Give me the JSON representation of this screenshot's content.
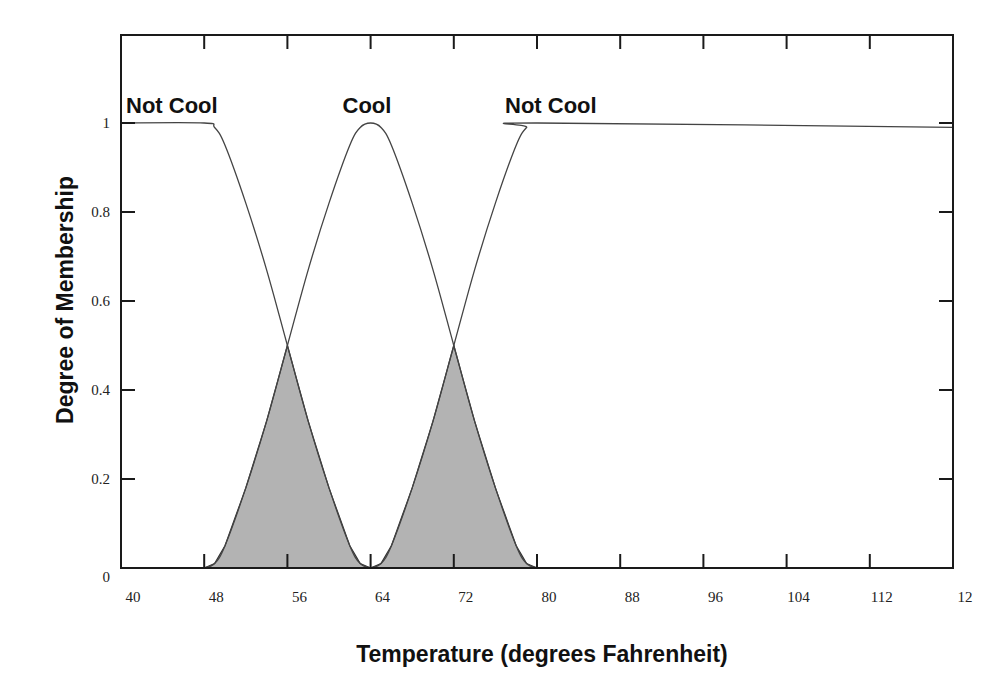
{
  "chart_data": {
    "type": "line",
    "title": "",
    "xlabel": "Temperature (degrees Fahrenheit)",
    "ylabel": "Degree of Membership",
    "xlim": [
      40,
      120
    ],
    "ylim": [
      0,
      1.2
    ],
    "x_ticks": [
      40,
      48,
      56,
      64,
      72,
      80,
      88,
      96,
      104,
      112,
      120
    ],
    "x_tick_labels": [
      "40",
      "48",
      "56",
      "64",
      "72",
      "80",
      "88",
      "96",
      "104",
      "112",
      "12"
    ],
    "y_ticks": [
      0,
      0.2,
      0.4,
      0.6,
      0.8,
      1
    ],
    "y_tick_labels": [
      "0",
      "0.2",
      "0.4",
      "0.6",
      "0.8",
      "1"
    ],
    "grid": false,
    "annotations": [
      {
        "text": "Not Cool",
        "x": 44,
        "y": 1.05
      },
      {
        "text": "Cool",
        "x": 64,
        "y": 1.05
      },
      {
        "text": "Not Cool",
        "x": 79,
        "y": 1.05
      }
    ],
    "series": [
      {
        "name": "Not Cool (left)",
        "x": [
          40,
          48,
          49,
          50,
          52,
          54,
          56,
          58,
          60,
          62,
          63,
          64
        ],
        "y": [
          1,
          1,
          0.99,
          0.95,
          0.82,
          0.67,
          0.5,
          0.33,
          0.18,
          0.05,
          0.01,
          0
        ]
      },
      {
        "name": "Cool",
        "x": [
          48,
          49,
          50,
          52,
          54,
          56,
          58,
          60,
          62,
          63,
          64,
          65,
          66,
          68,
          70,
          72,
          74,
          76,
          78,
          79,
          80
        ],
        "y": [
          0,
          0.01,
          0.05,
          0.18,
          0.33,
          0.5,
          0.67,
          0.82,
          0.95,
          0.99,
          1,
          0.99,
          0.95,
          0.82,
          0.67,
          0.5,
          0.33,
          0.18,
          0.05,
          0.01,
          0
        ]
      },
      {
        "name": "Not Cool (right)",
        "x": [
          64,
          65,
          66,
          68,
          70,
          72,
          74,
          76,
          78,
          79,
          80,
          120
        ],
        "y": [
          0,
          0.01,
          0.05,
          0.18,
          0.33,
          0.5,
          0.67,
          0.82,
          0.95,
          0.99,
          1,
          0.99
        ]
      }
    ],
    "shaded_regions": [
      {
        "name": "Overlap Not Cool / Cool",
        "x_range": [
          48,
          64
        ],
        "peak": {
          "x": 56,
          "y": 0.5
        },
        "color": "#b0b0b0"
      },
      {
        "name": "Overlap Cool / Not Cool",
        "x_range": [
          64,
          80
        ],
        "peak": {
          "x": 72,
          "y": 0.5
        },
        "color": "#b0b0b0"
      }
    ]
  },
  "colors": {
    "frame": "#1a1a1a",
    "curve": "#444444",
    "shade": "#b3b3b3"
  }
}
